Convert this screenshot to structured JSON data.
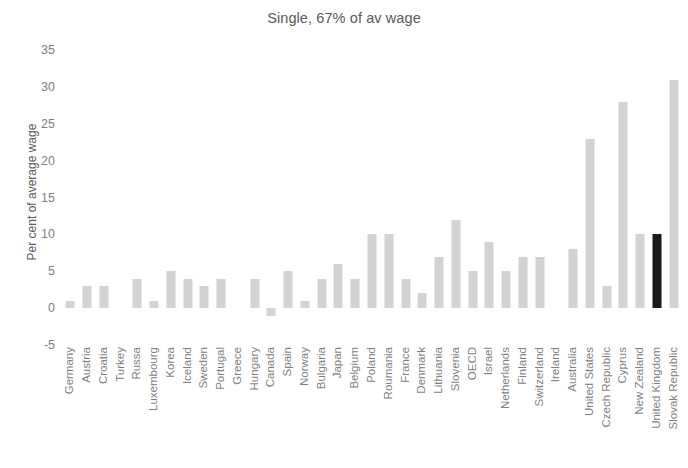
{
  "chart_data": {
    "type": "bar",
    "title": "Single, 67% of av wage",
    "xlabel": "",
    "ylabel": "Per cent of average wage",
    "ylim": [
      -5,
      35
    ],
    "yticks": [
      35,
      30,
      25,
      20,
      15,
      10,
      5,
      0,
      -5
    ],
    "grid": false,
    "legend": null,
    "bar_color": "#d2d2d2",
    "highlight_color": "#1a1a1a",
    "highlight_categories": [
      "United Kingdom"
    ],
    "categories": [
      "Germany",
      "Austria",
      "Croatia",
      "Turkey",
      "Russa",
      "Luxembourg",
      "Korea",
      "Iceland",
      "Sweden",
      "Portugal",
      "Greece",
      "Hungary",
      "Canada",
      "Spain",
      "Norway",
      "Bulgaria",
      "Japan",
      "Belgium",
      "Poland",
      "Roumania",
      "France",
      "Denmark",
      "Lithuania",
      "Slovenia",
      "OECD",
      "Israel",
      "Netherlands",
      "Finland",
      "Switzerland",
      "Ireland",
      "Australia",
      "United States",
      "Czech Republic",
      "Cyprus",
      "New Zealand",
      "United Kingdom",
      "Slovak Republic"
    ],
    "values": [
      1,
      3,
      3,
      0,
      4,
      1,
      5,
      4,
      3,
      4,
      0,
      4,
      -1,
      5,
      1,
      4,
      6,
      4,
      10,
      10,
      4,
      2,
      7,
      12,
      5,
      9,
      5,
      7,
      7,
      0,
      8,
      23,
      3,
      28,
      10,
      10,
      31
    ]
  }
}
